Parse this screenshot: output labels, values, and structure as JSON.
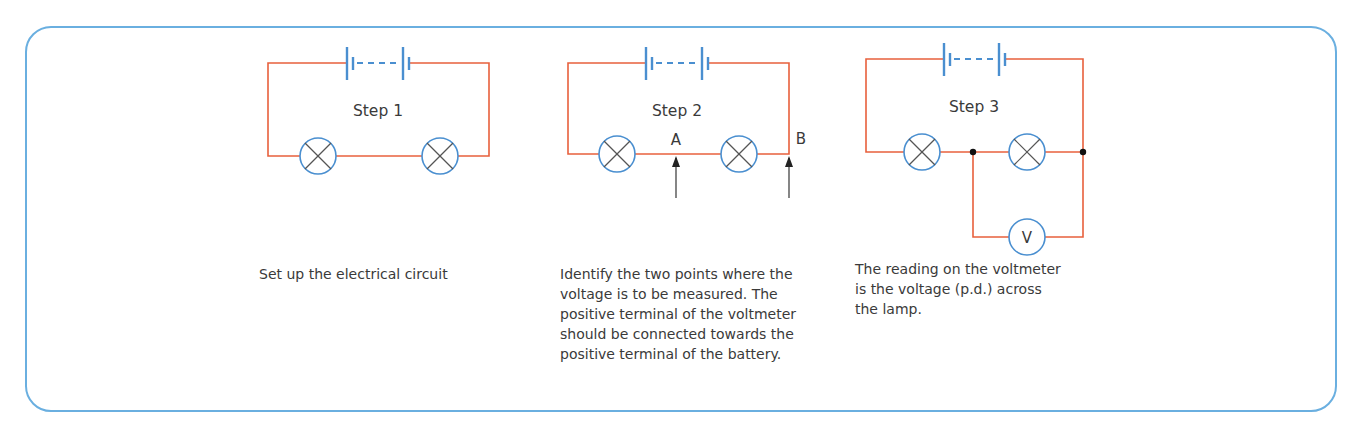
{
  "colors": {
    "frame": "#6aafe0",
    "wire": "#e8603c",
    "component": "#4a8fd0",
    "lamp_cross": "#555555",
    "text": "#3a3a3a"
  },
  "steps": [
    {
      "label": "Step 1",
      "caption_lines": [
        "Set up the electrical circuit"
      ],
      "components": [
        "battery",
        "lamp",
        "lamp"
      ]
    },
    {
      "label": "Step 2",
      "point_a": "A",
      "point_b": "B",
      "caption_lines": [
        "Identify the two points where the",
        "voltage is to be measured. The",
        "positive terminal of the voltmeter",
        "should be connected towards the",
        "positive terminal of the battery."
      ],
      "components": [
        "battery",
        "lamp",
        "lamp",
        "arrow-a",
        "arrow-b"
      ]
    },
    {
      "label": "Step 3",
      "voltmeter_symbol": "V",
      "caption_lines": [
        "The reading on the voltmeter",
        "is the voltage (p.d.) across",
        "the lamp."
      ],
      "components": [
        "battery",
        "lamp",
        "lamp",
        "voltmeter",
        "junction",
        "junction"
      ]
    }
  ]
}
